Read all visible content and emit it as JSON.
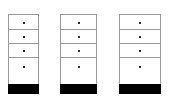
{
  "diagram": {
    "type": "cabinet-comparison",
    "cabinets": [
      {
        "id": "cabinet-1",
        "left": 8,
        "width": 31,
        "drawers": 4,
        "base_color": "#000000"
      },
      {
        "id": "cabinet-2",
        "left": 60,
        "width": 37,
        "drawers": 4,
        "base_color": "#000000"
      },
      {
        "id": "cabinet-3",
        "left": 119,
        "width": 42,
        "drawers": 4,
        "base_color": "#000000"
      }
    ],
    "drawer_rows": [
      {
        "top": 0,
        "height": 15,
        "knob_top": 7
      },
      {
        "top": 15,
        "height": 14,
        "knob_top": 6
      },
      {
        "top": 29,
        "height": 14,
        "knob_top": 6
      },
      {
        "top": 43,
        "height": 27,
        "knob_top": 8
      }
    ],
    "base": {
      "top": 70,
      "height": 10
    },
    "colors": {
      "outline": "#9a9a9a",
      "knob": "#333333",
      "base": "#000000",
      "background": "#ffffff"
    }
  }
}
